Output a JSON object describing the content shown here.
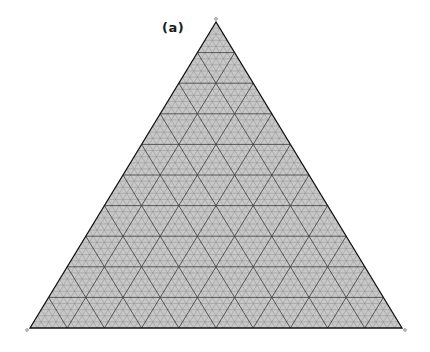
{
  "figure": {
    "panel_label": "(a)",
    "type": "ternary-grid",
    "colors": {
      "background": "#ffffff",
      "grid_fine": "#8a8a8a",
      "grid_major": "#3a3a3a",
      "outline": "#111111",
      "fill": "#c8c8c8"
    },
    "vertices": {
      "top": {
        "x": 216,
        "y": 22,
        "mark": "o"
      },
      "bottom_left": {
        "x": 30,
        "y": 328,
        "mark": "A"
      },
      "bottom_right": {
        "x": 402,
        "y": 328,
        "mark": "B"
      }
    },
    "grid": {
      "fine_divisions": 50,
      "major_every": 5
    },
    "side_marks": {
      "left_mid": "-",
      "right_mid": "-"
    }
  }
}
